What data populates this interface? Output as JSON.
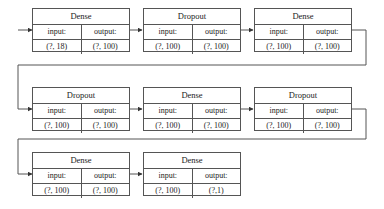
{
  "diagram": {
    "title": "",
    "nodes": [
      {
        "layer": "Dense",
        "input_label": "input:",
        "output_label": "output:",
        "input": "(?, 18)",
        "output": "(?, 100)"
      },
      {
        "layer": "Dropout",
        "input_label": "input:",
        "output_label": "output:",
        "input": "(?, 100)",
        "output": "(?, 100)"
      },
      {
        "layer": "Dense",
        "input_label": "input:",
        "output_label": "output:",
        "input": "(?, 100)",
        "output": "(?, 100)"
      },
      {
        "layer": "Dropout",
        "input_label": "input:",
        "output_label": "output:",
        "input": "(?, 100)",
        "output": "(?, 100)"
      },
      {
        "layer": "Dense",
        "input_label": "input:",
        "output_label": "output:",
        "input": "(?, 100)",
        "output": "(?, 100)"
      },
      {
        "layer": "Dropout",
        "input_label": "input:",
        "output_label": "output:",
        "input": "(?, 100)",
        "output": "(?, 100)"
      },
      {
        "layer": "Dense",
        "input_label": "input:",
        "output_label": "output:",
        "input": "(?, 100)",
        "output": "(?, 100)"
      },
      {
        "layer": "Dense",
        "input_label": "input:",
        "output_label": "output:",
        "input": "(?, 100)",
        "output": "(?,1)"
      }
    ],
    "colors": {
      "line": "#555555",
      "text": "#222222",
      "background": "#ffffff"
    }
  }
}
